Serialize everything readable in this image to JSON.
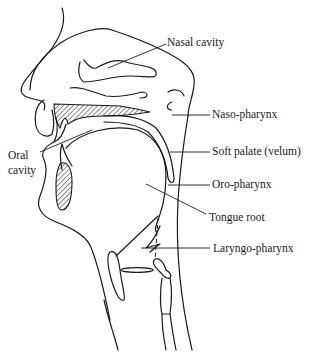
{
  "diagram": {
    "labels": {
      "nasal_cavity": "Nasal cavity",
      "naso_pharynx": "Naso-pharynx",
      "oral_cavity_line1": "Oral",
      "oral_cavity_line2": "cavity",
      "soft_palate": "Soft palate (velum)",
      "oro_pharynx": "Oro-pharynx",
      "tongue_root": "Tongue root",
      "laryngo_pharynx": "Laryngo-pharynx"
    },
    "colors": {
      "ink": "#1a1a1a",
      "background": "#ffffff"
    }
  }
}
